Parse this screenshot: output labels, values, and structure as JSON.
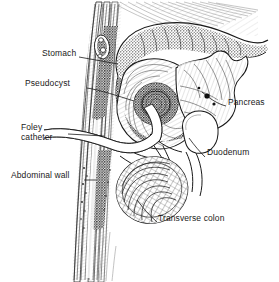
{
  "figure": {
    "type": "medical-illustration",
    "background_color": "#ffffff",
    "ink_color": "#1a1a1a",
    "width": 279,
    "height": 282
  },
  "labels": [
    {
      "id": "stomach",
      "text": "Stomach",
      "x": 42,
      "y": 53,
      "align": "left"
    },
    {
      "id": "pseudocyst",
      "text": "Pseudocyst",
      "x": 27,
      "y": 83,
      "align": "left"
    },
    {
      "id": "foley-catheter",
      "text": "Foley\ncatheter",
      "x": 21,
      "y": 127,
      "align": "left"
    },
    {
      "id": "abdominal-wall",
      "text": "Abdominal wall",
      "x": 12,
      "y": 175,
      "align": "left"
    },
    {
      "id": "pancreas",
      "text": "Pancreas",
      "x": 228,
      "y": 102,
      "align": "left"
    },
    {
      "id": "duodenum",
      "text": "Duodenum",
      "x": 207,
      "y": 152,
      "align": "left"
    },
    {
      "id": "transverse-colon",
      "text": "Transverse colon",
      "x": 158,
      "y": 218,
      "align": "left"
    }
  ],
  "structures": [
    {
      "id": "abdominal-wall",
      "name": "Abdominal wall",
      "description": "vertical layered band of skin, fat and muscle on the left of the field"
    },
    {
      "id": "stomach",
      "name": "Stomach",
      "description": "stippled organ arching across the upper field with rugal folds"
    },
    {
      "id": "pseudocyst",
      "name": "Pseudocyst",
      "description": "dark stippled round fluid collection behind the stomach"
    },
    {
      "id": "pancreas",
      "name": "Pancreas",
      "description": "lobulated leaf-shaped gland at the right of the pseudocyst"
    },
    {
      "id": "duodenum",
      "name": "Duodenum",
      "description": "open C-shaped loop outline at right of centre"
    },
    {
      "id": "transverse-colon",
      "name": "Transverse colon",
      "description": "cross-hatched rounded bowel loop in the lower field"
    },
    {
      "id": "foley-catheter",
      "name": "Foley catheter",
      "description": "white tube passing through the abdominal wall into the pseudocyst"
    },
    {
      "id": "vessel",
      "name": "Vessel cross-section",
      "description": "small dark oval structure in the upper abdominal wall"
    }
  ]
}
